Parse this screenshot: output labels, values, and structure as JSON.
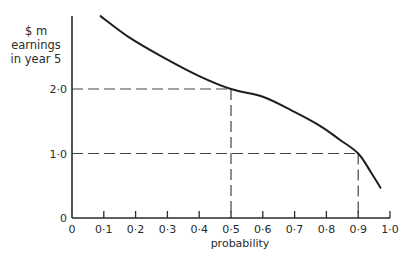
{
  "chart_data": {
    "type": "line",
    "title": "",
    "ylabel_lines": [
      "$ m",
      "earnings",
      "in year 5"
    ],
    "xlabel": "probability",
    "xlim": [
      0,
      1.0
    ],
    "ylim": [
      0,
      3.15
    ],
    "x_ticks": [
      0,
      0.1,
      0.2,
      0.3,
      0.4,
      0.5,
      0.6,
      0.7,
      0.8,
      0.9,
      1.0
    ],
    "x_tick_labels": [
      "0",
      "0·1",
      "0·2",
      "0·3",
      "0·4",
      "0·5",
      "0·6",
      "0·7",
      "0·8",
      "0·9",
      "1·0"
    ],
    "y_ticks": [
      0,
      1.0,
      2.0
    ],
    "y_tick_labels": [
      "0",
      "1·0",
      "2·0"
    ],
    "grid": false,
    "legend": null,
    "series": [
      {
        "name": "earnings curve",
        "x": [
          0.09,
          0.18,
          0.28,
          0.4,
          0.5,
          0.6,
          0.69,
          0.78,
          0.84,
          0.9,
          0.94,
          0.97
        ],
        "y": [
          3.13,
          2.8,
          2.51,
          2.2,
          2.0,
          1.88,
          1.67,
          1.43,
          1.22,
          1.0,
          0.71,
          0.47
        ]
      }
    ],
    "annotations": [
      {
        "type": "dashed-guide",
        "x": 0.5,
        "y": 2.0,
        "description": "probability 0.5 corresponds to $2.0m"
      },
      {
        "type": "dashed-guide",
        "x": 0.9,
        "y": 1.0,
        "description": "probability 0.9 corresponds to $1.0m"
      }
    ]
  }
}
